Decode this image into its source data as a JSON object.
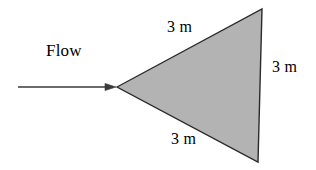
{
  "figure": {
    "background_color": "#ffffff",
    "flow_label": "Flow",
    "shape": {
      "name": "triangle",
      "fill_color": "#b3b3b3",
      "stroke_color": "#2b2b2b",
      "vertices": [
        {
          "x": 117,
          "y": 87
        },
        {
          "x": 262,
          "y": 9
        },
        {
          "x": 258,
          "y": 162
        }
      ]
    },
    "arrow": {
      "color": "#3a3a3a",
      "start_x": 18,
      "end_x": 116,
      "y": 87
    },
    "dimensions": {
      "top": "3 m",
      "bottom": "3 m",
      "right": "3 m"
    }
  },
  "chart_data": {
    "type": "diagram",
    "title": "",
    "annotations": [
      "Flow",
      "3 m",
      "3 m",
      "3 m"
    ],
    "shape_type": "triangle",
    "side_lengths": [
      3,
      3,
      3
    ],
    "units": "m"
  }
}
